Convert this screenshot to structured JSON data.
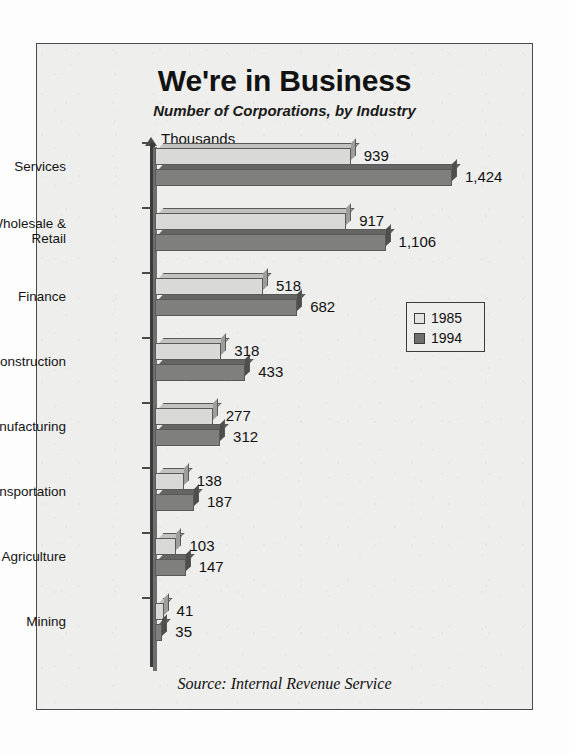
{
  "chart_data": {
    "type": "bar",
    "orientation": "horizontal",
    "title": "We're in Business",
    "subtitle": "Number of Corporations, by Industry",
    "unit_label": "Thousands",
    "xlabel": "",
    "ylabel": "",
    "xlim": [
      0,
      1424
    ],
    "grid": false,
    "legend_position": "right",
    "categories": [
      "Services",
      "Wholesale & Retail",
      "Finance",
      "Construction",
      "Manufacturing",
      "Transportation",
      "Agriculture",
      "Mining"
    ],
    "series": [
      {
        "name": "1985",
        "color": "#d9d9d7",
        "values": [
          939,
          917,
          518,
          318,
          277,
          138,
          103,
          41
        ],
        "labels": [
          "939",
          "917",
          "518",
          "318",
          "277",
          "138",
          "103",
          "41"
        ]
      },
      {
        "name": "1994",
        "color": "#7f7f7d",
        "values": [
          1424,
          1106,
          682,
          433,
          312,
          187,
          147,
          35
        ],
        "labels": [
          "1,424",
          "1,106",
          "682",
          "433",
          "312",
          "187",
          "147",
          "35"
        ]
      }
    ],
    "source": "Source:  Internal Revenue Service"
  },
  "category_label_lines": [
    [
      "Services"
    ],
    [
      "Wholesale &",
      "Retail"
    ],
    [
      "Finance"
    ],
    [
      "Construction"
    ],
    [
      "Manufacturing"
    ],
    [
      "Transportation"
    ],
    [
      "Agriculture"
    ],
    [
      "Mining"
    ]
  ],
  "legend": {
    "items": [
      {
        "label": "1985",
        "swatch": "light"
      },
      {
        "label": "1994",
        "swatch": "dark"
      }
    ]
  }
}
